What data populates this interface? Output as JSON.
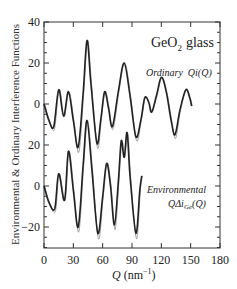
{
  "chart_data": {
    "type": "line",
    "title_main": "GeO",
    "title_sub": "2",
    "title_rest": "glass",
    "xlabel_main": "Q",
    "xlabel_unit": "(nm",
    "xlabel_exp": "−1",
    "xlabel_close": ")",
    "xlabel": "Q (nm−1)",
    "ylabel": "Environmental & Ordinary Interference Functions",
    "xlim": [
      0,
      180
    ],
    "xticks": [
      0,
      30,
      60,
      90,
      120,
      150,
      180
    ],
    "ytick_labels": [
      "40",
      "20",
      "0",
      "20",
      "0",
      "−20"
    ],
    "ytick_positions_px": [
      22,
      63,
      104,
      145,
      186,
      227
    ],
    "grid": false,
    "legend_position": "inline annotations",
    "series": [
      {
        "name": "Ordinary Qi(Q)",
        "label_main": "Ordinary",
        "label_func": "Qi(Q)",
        "offset": 0,
        "zero_px": 104,
        "x": [
          0,
          5,
          10,
          15,
          20,
          25,
          30,
          35,
          40,
          44,
          48,
          54,
          58,
          62,
          66,
          70,
          76,
          82,
          88,
          94,
          99,
          103,
          107,
          110,
          115,
          120,
          125,
          130,
          134,
          139,
          145,
          149,
          151
        ],
        "values": [
          0,
          -8,
          -11,
          7,
          -6,
          6,
          -8,
          -21,
          5,
          31,
          10,
          -19,
          -8,
          6,
          -2,
          -11,
          6,
          20,
          4,
          -16,
          -8,
          3,
          1,
          -4,
          4,
          13,
          6,
          -8,
          -15,
          -3,
          7,
          3,
          -1
        ]
      },
      {
        "name": "Environmental QΔi_Ge(Q)",
        "label_main": "Environmental",
        "label_func": "QΔi",
        "label_sub": "Ge",
        "label_tail": "(Q)",
        "offset": -40,
        "zero_px": 186,
        "x": [
          0,
          5,
          11,
          15,
          21,
          25,
          30,
          35,
          40,
          44,
          49,
          55,
          60,
          64,
          68,
          72,
          76,
          79,
          82,
          85,
          88,
          94,
          98,
          100
        ],
        "values": [
          0,
          -8,
          -11,
          6,
          -7,
          17,
          -2,
          -20,
          10,
          32,
          8,
          -23,
          -5,
          11,
          0,
          -19,
          2,
          22,
          14,
          26,
          5,
          -23,
          -2,
          5
        ]
      }
    ]
  }
}
